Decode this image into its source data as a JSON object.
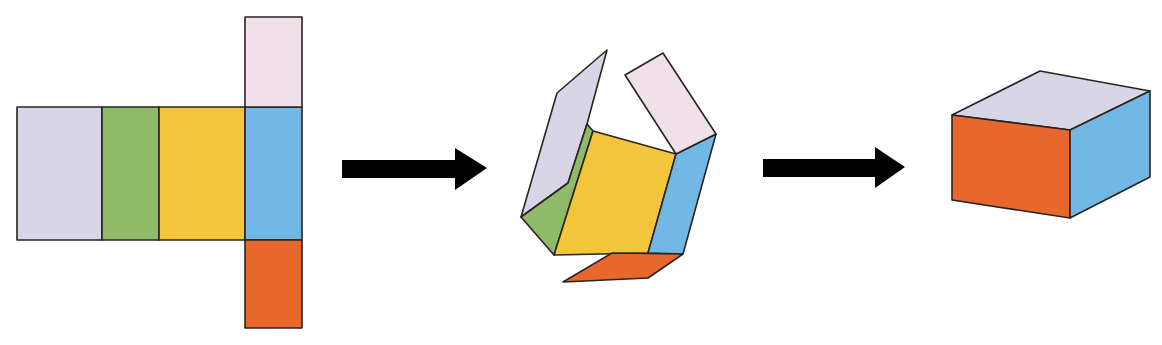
{
  "title": "Net of a rectangular prism folding into a box",
  "colors": {
    "lavender": "#d8d6e6",
    "green": "#8fba6a",
    "yellow": "#f3c53a",
    "blue": "#72b8e4",
    "pink": "#efe0ea",
    "orange": "#e8672c",
    "outline": "#2a2320",
    "arrow": "#000000"
  },
  "stages": [
    {
      "name": "flat-net",
      "description": "Unfolded net: four side faces in a row with top and bottom flaps"
    },
    {
      "name": "folding",
      "description": "Net partially folded"
    },
    {
      "name": "closed-box",
      "description": "Fully assembled rectangular box"
    }
  ],
  "net": {
    "faces": [
      {
        "name": "lavender-face",
        "color": "lavender",
        "x": 17,
        "y": 107,
        "w": 85,
        "h": 133
      },
      {
        "name": "green-face",
        "color": "green",
        "x": 102,
        "y": 107,
        "w": 57,
        "h": 133
      },
      {
        "name": "yellow-face",
        "color": "yellow",
        "x": 159,
        "y": 107,
        "w": 86,
        "h": 133
      },
      {
        "name": "blue-face",
        "color": "blue",
        "x": 245,
        "y": 107,
        "w": 57,
        "h": 133
      },
      {
        "name": "pink-flap",
        "color": "pink",
        "x": 245,
        "y": 17,
        "w": 57,
        "h": 90
      },
      {
        "name": "orange-flap",
        "color": "orange",
        "x": 245,
        "y": 240,
        "w": 57,
        "h": 88
      }
    ]
  },
  "folding": {
    "faces": [
      {
        "name": "lavender-face",
        "color": "lavender",
        "points": "607,50 587,124 568,183 521,217 557,93"
      },
      {
        "name": "green-face",
        "color": "green",
        "points": "587,124 593,131 554,255 521,217 568,183"
      },
      {
        "name": "yellow-face",
        "color": "yellow",
        "points": "593,131 676,154 648,253 554,255"
      },
      {
        "name": "blue-face",
        "color": "blue",
        "points": "676,154 716,134 683,254 648,253"
      },
      {
        "name": "pink-flap",
        "color": "pink",
        "points": "625,75 663,53 716,134 676,154"
      },
      {
        "name": "orange-flap",
        "color": "orange",
        "points": "612,253 683,254 648,278 563,282"
      }
    ]
  },
  "arrows": [
    {
      "name": "arrow-1",
      "points": "342,160 455,160 455,148 487,168 455,190 455,178 342,178"
    },
    {
      "name": "arrow-2",
      "points": "763,159 875,159 875,147 905,167 875,188 875,177 763,177"
    }
  ],
  "box": {
    "faces": [
      {
        "name": "top-face",
        "color": "lavender",
        "points": "952,115 1040,71 1150,91 1070,130"
      },
      {
        "name": "front-face",
        "color": "orange",
        "points": "952,115 1070,130 1070,218 952,200"
      },
      {
        "name": "right-face",
        "color": "blue",
        "points": "1070,130 1150,91 1150,177 1070,218"
      }
    ]
  }
}
